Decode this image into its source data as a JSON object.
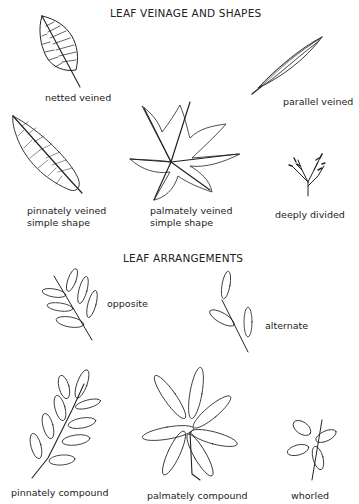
{
  "sections": {
    "veinage": {
      "title": "LEAF VEINAGE AND SHAPES",
      "items": [
        {
          "label": "netted veined"
        },
        {
          "label": "parallel veined"
        },
        {
          "label_line1": "pinnately veined",
          "label_line2": "simple shape"
        },
        {
          "label_line1": "palmately veined",
          "label_line2": "simple shape"
        },
        {
          "label": "deeply divided"
        }
      ]
    },
    "arrangements": {
      "title": "LEAF ARRANGEMENTS",
      "items": [
        {
          "label": "opposite"
        },
        {
          "label": "alternate"
        },
        {
          "label": "pinnately compound"
        },
        {
          "label": "palmately compound"
        },
        {
          "label": "whorled"
        }
      ]
    }
  },
  "colors": {
    "ink": "#222222",
    "background": "#ffffff"
  }
}
